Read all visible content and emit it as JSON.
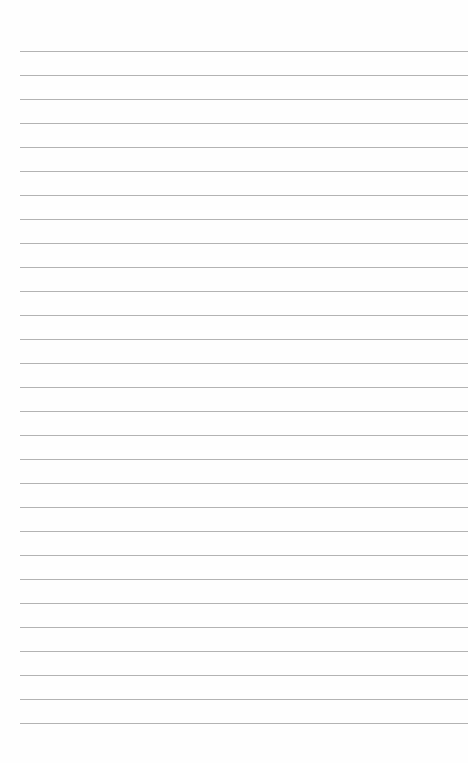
{
  "page": {
    "type": "lined-paper",
    "line_count": 29,
    "first_line_y": 51,
    "line_spacing": 24,
    "line_left_margin": 20,
    "line_color": "#9a9a9a",
    "background_color": "#fefefe"
  }
}
